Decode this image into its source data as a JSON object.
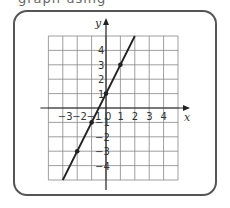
{
  "header": {
    "cut_text": "graph using"
  },
  "chart_data": {
    "type": "line",
    "title": "",
    "xlabel": "x",
    "ylabel": "y",
    "xlim": [
      -4,
      5
    ],
    "ylim": [
      -5,
      5
    ],
    "grid": true,
    "equation": "y = 2x + 1",
    "x_tick_labels": [
      "-3",
      "-2",
      "-1",
      "0",
      "1",
      "2",
      "3",
      "4"
    ],
    "y_tick_labels": [
      "4",
      "3",
      "2",
      "1",
      "-1",
      "-2",
      "-3",
      "-4"
    ],
    "series": [
      {
        "name": "line",
        "x": [
          -3,
          2
        ],
        "y": [
          -5,
          5
        ]
      }
    ],
    "points": [
      {
        "x": -2,
        "y": -3
      },
      {
        "x": -1,
        "y": -1
      },
      {
        "x": 0,
        "y": 1
      },
      {
        "x": 1,
        "y": 3
      }
    ],
    "colors": {
      "line": "#222222",
      "grid": "#888888",
      "frame": "#555555"
    }
  }
}
